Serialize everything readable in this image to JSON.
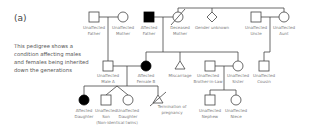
{
  "panel_label": "(a)",
  "description": "This pedigree shows a condition affecting males and females being inherited down the generations",
  "colors": {
    "affected": "#000000",
    "unaffected": "#ffffff",
    "line": "#444444",
    "label": "#7a7a7a"
  },
  "individuals": {
    "g1_father": {
      "shape": "square",
      "status": "unaffected",
      "label1": "Unaffected",
      "label2": "Father"
    },
    "g1_mother": {
      "shape": "circle",
      "status": "unaffected",
      "label1": "Unaffected",
      "label2": "Mother"
    },
    "g1_aff_father": {
      "shape": "square",
      "status": "affected",
      "label1": "Affected",
      "label2": "Father"
    },
    "g1_dec_mother": {
      "shape": "circle",
      "status": "deceased",
      "label1": "Deceased",
      "label2": "Mother"
    },
    "g1_unknown": {
      "shape": "diamond",
      "status": "unknown",
      "label1": "Gender unknown"
    },
    "g1_uncle": {
      "shape": "square",
      "status": "unaffected",
      "label1": "Unaffected",
      "label2": "Uncle"
    },
    "g1_aunt": {
      "shape": "circle",
      "status": "unaffected",
      "label1": "Unaffected",
      "label2": "Aunt"
    },
    "g2_male_a": {
      "shape": "square",
      "status": "unaffected",
      "label1": "Unaffected",
      "label2": "Male A"
    },
    "g2_female_b": {
      "shape": "circle",
      "status": "affected",
      "label1": "Affected",
      "label2": "Female B"
    },
    "g2_miscarriage": {
      "shape": "triangle",
      "label1": "Miscarriage"
    },
    "g2_bil": {
      "shape": "square",
      "status": "unaffected",
      "label1": "Unaffected",
      "label2": "Brother-in-Law"
    },
    "g2_sister": {
      "shape": "circle",
      "status": "unaffected",
      "label1": "Unaffected",
      "label2": "Sister"
    },
    "g2_cousin": {
      "shape": "square",
      "status": "unaffected",
      "label1": "Unaffected",
      "label2": "Cousin"
    },
    "g3_aff_daughter": {
      "shape": "circle",
      "status": "affected",
      "label1": "Affected",
      "label2": "Daughter"
    },
    "g3_son": {
      "shape": "square",
      "status": "unaffected",
      "label1": "Unaffected",
      "label2": "Son"
    },
    "g3_daughter": {
      "shape": "circle",
      "status": "unaffected",
      "label1": "Unaffected",
      "label2": "Daughter"
    },
    "g3_twins_note": "(Non-identical twins)",
    "g3_termination": {
      "shape": "triangle-crossed",
      "label1": "Termination of",
      "label2": "pregnancy"
    },
    "g3_nephew": {
      "shape": "square",
      "status": "unaffected",
      "label1": "Unaffected",
      "label2": "Nephew"
    },
    "g3_niece": {
      "shape": "circle",
      "status": "unaffected",
      "label1": "Unaffected",
      "label2": "Niece"
    }
  }
}
